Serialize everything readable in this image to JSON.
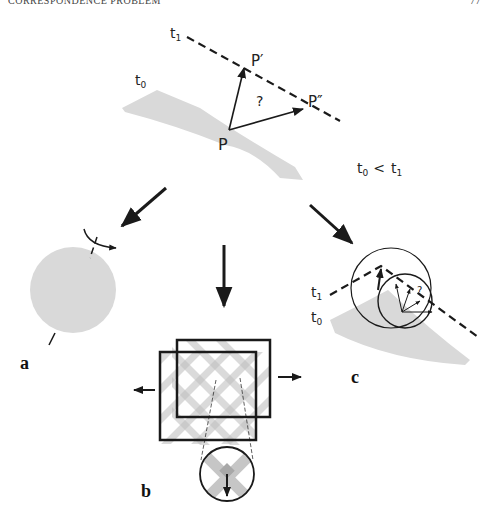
{
  "header": {
    "running_title": "CORRESPONDENCE PROBLEM",
    "page_number": "77"
  },
  "top_panel": {
    "t1_label": "t",
    "t1_sub": "1",
    "t0_label": "t",
    "t0_sub": "0",
    "p_label": "P",
    "p_prime_label": "P′",
    "p_double_prime_label": "P″",
    "question": "?",
    "inequality_t0": "t",
    "inequality_t0_sub": "0",
    "inequality_op": "<",
    "inequality_t1": "t",
    "inequality_t1_sub": "1"
  },
  "panels": {
    "a": {
      "label": "a"
    },
    "b": {
      "label": "b"
    },
    "c": {
      "label": "c",
      "t1_label": "t",
      "t1_sub": "1",
      "t0_label": "t",
      "t0_sub": "0",
      "question": "?"
    }
  },
  "colors": {
    "ink": "#1a1a1a",
    "shape_fill": "#d9d9d9",
    "grid_stripe": "#cfcfcf",
    "grid_overlap": "#b0b0b0"
  }
}
